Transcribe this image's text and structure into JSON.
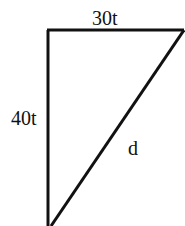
{
  "diagram": {
    "type": "right-triangle",
    "labels": {
      "top": "30t",
      "left": "40t",
      "hypotenuse": "d"
    },
    "stroke_color": "#111111",
    "background": "#ffffff"
  }
}
